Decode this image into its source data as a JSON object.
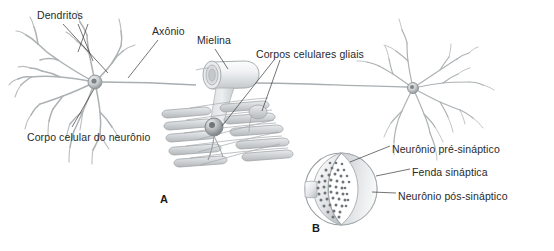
{
  "figure": {
    "background_color": "#ffffff",
    "ink_color": "#2a2a2a",
    "structure_color": "#b9bcbe",
    "panels": [
      {
        "letter": "A",
        "x": 160,
        "y": 193
      },
      {
        "letter": "B",
        "x": 312,
        "y": 222
      }
    ],
    "labels": [
      {
        "id": "dendritos",
        "text": "Dendritos",
        "x": 37,
        "y": 9
      },
      {
        "id": "axonio",
        "text": "Axônio",
        "x": 152,
        "y": 25
      },
      {
        "id": "mielina",
        "text": "Mielina",
        "x": 197,
        "y": 34
      },
      {
        "id": "corpos-gliais",
        "text": "Corpos celulares gliais",
        "x": 256,
        "y": 48
      },
      {
        "id": "corpo-celular",
        "text": "Corpo celular do neurônio",
        "x": 27,
        "y": 131
      },
      {
        "id": "neuronio-pre",
        "text": "Neurônio pré-sináptico",
        "x": 392,
        "y": 143
      },
      {
        "id": "fenda",
        "text": "Fenda sináptica",
        "x": 412,
        "y": 166
      },
      {
        "id": "neuronio-pos",
        "text": "Neurônio pós-sináptico",
        "x": 398,
        "y": 190
      }
    ],
    "leader_lines": [
      {
        "id": "leader-dendritos-1",
        "points": "63,24 108,73"
      },
      {
        "id": "leader-dendritos-2",
        "points": "78,24 92,61"
      },
      {
        "id": "leader-dendritos-3",
        "points": "88,24 78,52"
      },
      {
        "id": "leader-axonio",
        "points": "158,40 128,78"
      },
      {
        "id": "leader-mielina",
        "points": "215,49 228,70"
      },
      {
        "id": "leader-gliais-1",
        "points": "276,60 236,128"
      },
      {
        "id": "leader-gliais-2",
        "points": "282,60 258,110"
      },
      {
        "id": "leader-corpo",
        "points": "72,127 94,87"
      },
      {
        "id": "leader-pre",
        "points": "390,146 354,163"
      },
      {
        "id": "leader-fenda",
        "points": "408,170 374,176"
      },
      {
        "id": "leader-pos",
        "points": "394,193 370,191"
      }
    ],
    "axon_line": {
      "id": "axon-shaft",
      "from_x": 98,
      "from_y": 82,
      "to_x": 406,
      "to_y": 86
    },
    "left_neuron": {
      "id": "left-neuron",
      "soma_x": 95,
      "soma_y": 82,
      "soma_r": 7
    },
    "right_neuron": {
      "id": "right-neuron",
      "soma_x": 413,
      "soma_y": 88,
      "soma_r": 5
    },
    "myelin": {
      "id": "myelin-sheath",
      "x": 194,
      "y": 61,
      "w": 62,
      "h": 27
    },
    "glial_body": {
      "id": "glial-cell-body",
      "x": 214,
      "y": 127,
      "r": 9
    },
    "synapse": {
      "id": "synapse-circle",
      "cx": 341,
      "cy": 189,
      "r": 36,
      "vesicle_count": 46
    }
  }
}
